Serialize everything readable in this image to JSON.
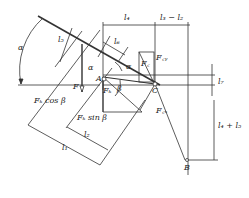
{
  "diagram": {
    "type": "mechanics force diagram",
    "points": {
      "A": "A",
      "B": "B",
      "C": "C"
    },
    "angles": {
      "alpha_outer": "α",
      "alpha_inner": "α",
      "beta": "β"
    },
    "forces": {
      "F": "F",
      "F_K": "Fₖ",
      "F_K_cos": "Fₖ cos β",
      "F_K_sin": "Fₖ sin β",
      "F_C": "F꜀",
      "F_Cy": "F꜀ᵧ",
      "F_Cx": "F꜀ₓ"
    },
    "dimensions": {
      "l1": "l₁",
      "l2": "l₂",
      "l3_minus_l2": "l₃ − l₂",
      "l4": "l₄",
      "l5": "l₅",
      "l6": "l₆",
      "l7": "l₇",
      "l4_plus_l5": "l₄ + l₅"
    }
  }
}
